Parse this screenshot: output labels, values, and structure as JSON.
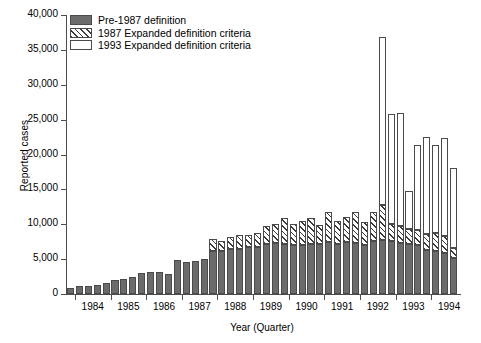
{
  "chart_data": {
    "type": "bar",
    "title": "",
    "xlabel": "Year (Quarter)",
    "ylabel": "Reported cases",
    "ylim": [
      0,
      40000
    ],
    "ytick_labels": [
      "0",
      "5,000",
      "10,000",
      "15,000",
      "20,000",
      "25,000",
      "30,000",
      "35,000",
      "40,000"
    ],
    "ytick_values": [
      0,
      5000,
      10000,
      15000,
      20000,
      25000,
      30000,
      35000,
      40000
    ],
    "xtick_labels": [
      "1984",
      "1985",
      "1986",
      "1987",
      "1988",
      "1989",
      "1990",
      "1991",
      "1992",
      "1993",
      "1994"
    ],
    "grid": false,
    "legend_position": "top-left",
    "stacked": true,
    "series": [
      {
        "name": "Pre-1987 definition",
        "fill": "solid-dark-gray",
        "color": "#6b6b6b",
        "values": [
          900,
          1100,
          1150,
          1350,
          1600,
          2000,
          2150,
          2500,
          2950,
          3150,
          3100,
          2900,
          4900,
          4600,
          4800,
          5000,
          6200,
          6200,
          6400,
          6500,
          6700,
          6800,
          7200,
          7300,
          7100,
          7000,
          7000,
          7200,
          7200,
          7400,
          7200,
          7500,
          7300,
          7000,
          7600,
          7800,
          7600,
          7300,
          7100,
          7000,
          6300,
          6200,
          5900,
          5200
        ]
      },
      {
        "name": "1987 Expanded definition criteria",
        "fill": "diagonal-hatch",
        "color": "#ffffff",
        "values": [
          0,
          0,
          0,
          0,
          0,
          0,
          0,
          0,
          0,
          0,
          0,
          0,
          0,
          0,
          0,
          0,
          1700,
          1400,
          1800,
          1900,
          1700,
          2000,
          2500,
          2800,
          3800,
          3000,
          3400,
          3700,
          2700,
          4300,
          3200,
          3500,
          4500,
          3300,
          4100,
          5000,
          2500,
          2400,
          2200,
          2200,
          2300,
          2500,
          2400,
          1400
        ]
      },
      {
        "name": "1993 Expanded definition criteria",
        "fill": "white-open",
        "color": "#ffffff",
        "values": [
          0,
          0,
          0,
          0,
          0,
          0,
          0,
          0,
          0,
          0,
          0,
          0,
          0,
          0,
          0,
          0,
          0,
          0,
          0,
          0,
          0,
          0,
          0,
          0,
          0,
          0,
          0,
          0,
          0,
          0,
          0,
          0,
          0,
          0,
          0,
          24000,
          15700,
          16300,
          5400,
          12200,
          13900,
          12600,
          14100,
          11400
        ]
      }
    ],
    "quarters": [
      "1983 Q4",
      "1984 Q1",
      "1984 Q2",
      "1984 Q3",
      "1984 Q4",
      "1985 Q1",
      "1985 Q2",
      "1985 Q3",
      "1985 Q4",
      "1986 Q1",
      "1986 Q2",
      "1986 Q3",
      "1986 Q4",
      "1987 Q1",
      "1987 Q2",
      "1987 Q3",
      "1987 Q4",
      "1988 Q1",
      "1988 Q2",
      "1988 Q3",
      "1988 Q4",
      "1989 Q1",
      "1989 Q2",
      "1989 Q3",
      "1989 Q4",
      "1990 Q1",
      "1990 Q2",
      "1990 Q3",
      "1990 Q4",
      "1991 Q1",
      "1991 Q2",
      "1991 Q3",
      "1991 Q4",
      "1992 Q1",
      "1992 Q2",
      "1992 Q3",
      "1992 Q4",
      "1993 Q1",
      "1993 Q2",
      "1993 Q3",
      "1993 Q4",
      "1994 Q1",
      "1994 Q2",
      "1994 Q3"
    ],
    "totals": [
      900,
      1100,
      1150,
      1350,
      1600,
      2000,
      2150,
      2500,
      2950,
      3150,
      3100,
      2900,
      4900,
      4600,
      4800,
      5000,
      7900,
      7600,
      8200,
      8400,
      8400,
      8800,
      9700,
      10100,
      10900,
      10000,
      10400,
      10900,
      9900,
      11700,
      10400,
      11000,
      11800,
      10300,
      11700,
      36800,
      25800,
      26000,
      14700,
      21400,
      22500,
      21300,
      22400,
      18000
    ]
  },
  "legend": {
    "entries": [
      {
        "label": "Pre-1987 definition"
      },
      {
        "label": "1987 Expanded definition criteria"
      },
      {
        "label": "1993 Expanded definition criteria"
      }
    ]
  }
}
